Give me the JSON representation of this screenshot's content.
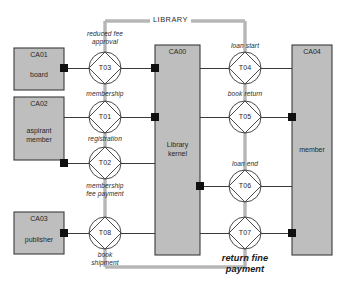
{
  "diagram": {
    "title": "LIBRARY",
    "boundary_label": "LIBRARY",
    "colors": {
      "box_fill": "#bebebe",
      "box_stroke": "#3b3b3b",
      "line": "#3a3a3a",
      "boundary": "#b5b5b5",
      "connector": "#101010",
      "text": "#262626"
    }
  },
  "boxes": [
    {
      "id": "CA01",
      "code": "CA01",
      "name": "board",
      "x": 14,
      "y": 48,
      "w": 50,
      "h": 42
    },
    {
      "id": "CA02",
      "code": "CA02",
      "name": "aspirant\nmember",
      "x": 14,
      "y": 97,
      "w": 50,
      "h": 63
    },
    {
      "id": "CA03",
      "code": "CA03",
      "name": "publisher",
      "x": 14,
      "y": 212,
      "w": 50,
      "h": 42
    },
    {
      "id": "CA00",
      "code": "CA00",
      "name": "Library\nkernel",
      "x": 155,
      "y": 45,
      "w": 45,
      "h": 210
    },
    {
      "id": "CA04",
      "code": "CA04",
      "name": "member",
      "x": 292,
      "y": 45,
      "w": 40,
      "h": 210
    }
  ],
  "transitions": [
    {
      "id": "T03",
      "label": "T03",
      "cx": 105,
      "cy": 68,
      "r": 16,
      "caption": "reduced fee\napproval",
      "caption_pos": "above"
    },
    {
      "id": "T01",
      "label": "T01",
      "cx": 105,
      "cy": 117,
      "r": 16,
      "caption": "membership",
      "caption_pos": "above"
    },
    {
      "id": "T02",
      "label": "T02",
      "cx": 105,
      "cy": 163,
      "r": 16,
      "caption": "registration",
      "caption_pos": "above",
      "caption2": "membership\nfee payment"
    },
    {
      "id": "T08",
      "label": "T08",
      "cx": 105,
      "cy": 233,
      "r": 16,
      "caption": "book\nshipment",
      "caption_pos": "below"
    },
    {
      "id": "T04",
      "label": "T04",
      "cx": 245,
      "cy": 68,
      "r": 16,
      "caption": "loan start",
      "caption_pos": "above"
    },
    {
      "id": "T05",
      "label": "T05",
      "cx": 245,
      "cy": 117,
      "r": 16,
      "caption": "book return",
      "caption_pos": "above"
    },
    {
      "id": "T06",
      "label": "T06",
      "cx": 245,
      "cy": 186,
      "r": 16,
      "caption": "loan end",
      "caption_pos": "above"
    },
    {
      "id": "T07",
      "label": "T07",
      "cx": 245,
      "cy": 233,
      "r": 16,
      "caption": "return fine\npayment",
      "caption_pos": "below",
      "emphasis": true
    }
  ],
  "captions": [
    {
      "key": "reduced-fee-approval",
      "line1": "reduced fee",
      "line2": "approval"
    },
    {
      "key": "membership",
      "line1": "membership"
    },
    {
      "key": "registration",
      "line1": "registration"
    },
    {
      "key": "membership-fee-payment",
      "line1": "membership",
      "line2": "fee payment"
    },
    {
      "key": "book-shipment",
      "line1": "book",
      "line2": "shipment"
    },
    {
      "key": "loan-start",
      "line1": "loan start"
    },
    {
      "key": "book-return",
      "line1": "book return"
    },
    {
      "key": "loan-end",
      "line1": "loan end"
    },
    {
      "key": "return-fine-payment",
      "line1": "return fine",
      "line2": "payment"
    }
  ],
  "connectors": [
    {
      "from": "CA01",
      "to": "T03",
      "marker_at": "source"
    },
    {
      "from": "CA02",
      "to": "T01",
      "marker_at": "none"
    },
    {
      "from": "CA02",
      "to": "T02",
      "marker_at": "source"
    },
    {
      "from": "CA03",
      "to": "T08",
      "marker_at": "source"
    },
    {
      "from": "T03",
      "to": "CA00",
      "marker_at": "target"
    },
    {
      "from": "T01",
      "to": "CA00",
      "marker_at": "target"
    },
    {
      "from": "T02",
      "to": "CA00",
      "marker_at": "none"
    },
    {
      "from": "T08",
      "to": "CA00",
      "marker_at": "none"
    },
    {
      "from": "CA00",
      "to": "T04",
      "marker_at": "none"
    },
    {
      "from": "CA00",
      "to": "T05",
      "marker_at": "none"
    },
    {
      "from": "CA00",
      "to": "T06",
      "marker_at": "source"
    },
    {
      "from": "CA00",
      "to": "T07",
      "marker_at": "none"
    },
    {
      "from": "T04",
      "to": "CA04",
      "marker_at": "none"
    },
    {
      "from": "T05",
      "to": "CA04",
      "marker_at": "target"
    },
    {
      "from": "T06",
      "to": "CA04",
      "marker_at": "none"
    },
    {
      "from": "T07",
      "to": "CA04",
      "marker_at": "target"
    }
  ]
}
